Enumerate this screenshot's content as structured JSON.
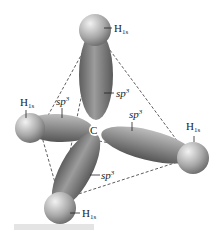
{
  "center_atom": "C",
  "hybrid_label": "sp",
  "hybrid_sup": "3",
  "h_label": "H",
  "h_sub": "1s",
  "colors": {
    "orbital": "#7a7a7a",
    "sphere": "#9a9a9a",
    "edges": "#333333"
  }
}
